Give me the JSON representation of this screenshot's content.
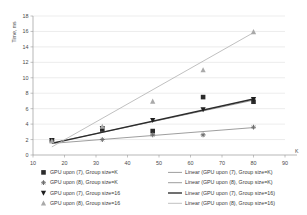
{
  "chart_data": {
    "type": "scatter",
    "title": "",
    "xlabel": "K",
    "ylabel": "Time, ms",
    "xlim": [
      10,
      90
    ],
    "ylim": [
      0,
      18
    ],
    "xticks": [
      10,
      20,
      30,
      40,
      50,
      60,
      70,
      80,
      90
    ],
    "yticks": [
      0,
      2,
      4,
      6,
      8,
      10,
      12,
      14,
      16,
      18
    ],
    "grid": true,
    "legend_position": "bottom",
    "x": [
      16,
      32,
      48,
      64,
      80
    ],
    "series": [
      {
        "name": "GPU upon (7), Group size=K",
        "marker": "square",
        "color": "#2b2b2b",
        "values": [
          1.9,
          3.3,
          3.1,
          7.5,
          6.9
        ],
        "trend_name": "Linear (GPU upon (7), Group size=K)",
        "trend_color": "#8c8c8c",
        "trend_from": [
          16,
          1.55
        ],
        "trend_to": [
          80,
          7.1
        ]
      },
      {
        "name": "GPU upon (8), Group size=K",
        "marker": "plus",
        "color": "#6e6e6e",
        "values": [
          1.85,
          2.0,
          2.6,
          2.6,
          3.6
        ],
        "trend_name": "Linear (GPU upon (8), Group size=K)",
        "trend_color": "#8c8c8c",
        "trend_from": [
          16,
          1.5
        ],
        "trend_to": [
          80,
          3.55
        ]
      },
      {
        "name": "GPU upon (7), Group size=16",
        "marker": "triangle-down",
        "color": "#1f1f1f",
        "values": [
          1.9,
          3.45,
          4.5,
          5.9,
          7.2
        ],
        "trend_name": "Linear (GPU upon (7), Group size=16)",
        "trend_color": "#2b2b2b",
        "trend_from": [
          16,
          1.5
        ],
        "trend_to": [
          80,
          7.25
        ]
      },
      {
        "name": "GPU upon (8), Group size=16",
        "marker": "triangle-up",
        "color": "#a9a9a9",
        "values": [
          1.8,
          3.7,
          6.95,
          11.0,
          15.95
        ],
        "trend_name": "Linear (GPU upon (8), Group size=16)",
        "trend_color": "#b5b5b5",
        "trend_from": [
          16,
          1.05
        ],
        "trend_to": [
          80,
          15.85
        ]
      }
    ]
  },
  "axes": {
    "y_label": "Time, ms",
    "x_label": "K",
    "y_tick_labels": [
      "0",
      "2",
      "4",
      "6",
      "8",
      "10",
      "12",
      "14",
      "16",
      "18"
    ],
    "x_tick_labels": [
      "10",
      "20",
      "30",
      "40",
      "50",
      "60",
      "70",
      "80",
      "90"
    ]
  },
  "legend": {
    "marker_entries": [
      "GPU upon (7), Group size=K",
      "GPU upon (8), Group size=K",
      "GPU upon (7), Group size=16",
      "GPU upon (8), Group size=16"
    ],
    "line_entries": [
      "Linear (GPU upon (7), Group size=K)",
      "Linear (GPU upon (8), Group size=K)",
      "Linear (GPU upon (7), Group size=16)",
      "Linear (GPU upon (8), Group size=16)"
    ]
  }
}
